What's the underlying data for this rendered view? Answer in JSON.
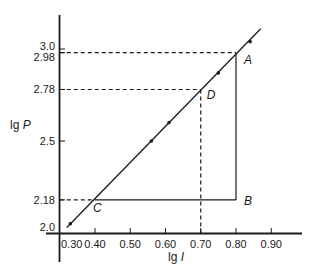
{
  "chart_data": {
    "type": "line",
    "title": "",
    "xlabel": "lg I",
    "ylabel": "lg P",
    "xlabel_parts": {
      "prefix": "lg",
      "var": "I"
    },
    "ylabel_parts": {
      "prefix": "lg",
      "var": "P"
    },
    "xlim": [
      0.3,
      0.97
    ],
    "ylim": [
      2.0,
      3.2
    ],
    "grid": false,
    "legend": null,
    "x_ticks": [
      0.3,
      0.4,
      0.5,
      0.6,
      0.7,
      0.8,
      0.9
    ],
    "x_tick_labels": [
      "0.30",
      "0.40",
      "0.50",
      "0.60",
      "0.70",
      "0.80",
      "0.90"
    ],
    "y_ticks": [
      2.0,
      2.18,
      2.5,
      2.78,
      2.98,
      3.0
    ],
    "y_tick_labels": [
      "2.0",
      "2.18",
      "2.5",
      "2.78",
      "2.98",
      "3.0"
    ],
    "series": [
      {
        "name": "measured points",
        "x": [
          0.33,
          0.56,
          0.61,
          0.75,
          0.84
        ],
        "y": [
          2.05,
          2.5,
          2.6,
          2.87,
          3.04
        ]
      }
    ],
    "fit_line": {
      "x": [
        0.32,
        0.87
      ],
      "y": [
        2.03,
        3.11
      ]
    },
    "annotations": [
      {
        "label": "A",
        "x": 0.8,
        "y": 2.98
      },
      {
        "label": "B",
        "x": 0.8,
        "y": 2.18
      },
      {
        "label": "C",
        "x": 0.4,
        "y": 2.18
      },
      {
        "label": "D",
        "x": 0.7,
        "y": 2.78
      }
    ],
    "guide_lines": [
      {
        "style": "dashed",
        "from": [
          0.3,
          2.98
        ],
        "to": [
          0.8,
          2.98
        ]
      },
      {
        "style": "dashed",
        "from": [
          0.3,
          2.78
        ],
        "to": [
          0.7,
          2.78
        ]
      },
      {
        "style": "dashed",
        "from": [
          0.7,
          2.78
        ],
        "to": [
          0.7,
          2.0
        ]
      },
      {
        "style": "dashed",
        "from": [
          0.3,
          2.18
        ],
        "to": [
          0.4,
          2.18
        ]
      },
      {
        "style": "solid",
        "from": [
          0.4,
          2.18
        ],
        "to": [
          0.8,
          2.18
        ]
      },
      {
        "style": "solid",
        "from": [
          0.8,
          2.18
        ],
        "to": [
          0.8,
          2.98
        ]
      }
    ]
  },
  "colors": {
    "ink": "#1a1a1a",
    "background": "#ffffff"
  }
}
